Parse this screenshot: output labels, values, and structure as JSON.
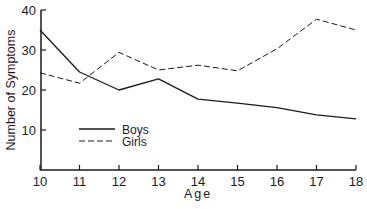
{
  "chart_data": {
    "type": "line",
    "title": "",
    "xlabel": "Age",
    "ylabel": "Number of Symptoms",
    "x": [
      10,
      11,
      12,
      13,
      14,
      15,
      16,
      17,
      18
    ],
    "xticks": [
      "10",
      "11",
      "12",
      "13",
      "14",
      "15",
      "16",
      "17",
      "18"
    ],
    "yticks": [
      "10",
      "20",
      "30",
      "40"
    ],
    "ylim": [
      0,
      40
    ],
    "xlim": [
      10,
      18
    ],
    "grid": false,
    "legend_position": "lower-left inside",
    "series": [
      {
        "name": "Boys",
        "style": "solid",
        "values": [
          35,
          24.5,
          20,
          22.8,
          17.7,
          16.7,
          15.6,
          13.8,
          12.8
        ]
      },
      {
        "name": "Girls",
        "style": "dashed",
        "values": [
          24.3,
          21.7,
          29.4,
          25,
          26.2,
          24.8,
          30.3,
          37.7,
          35
        ]
      }
    ]
  },
  "colors": {
    "line": "#1a1a1a",
    "background": "#ffffff"
  }
}
